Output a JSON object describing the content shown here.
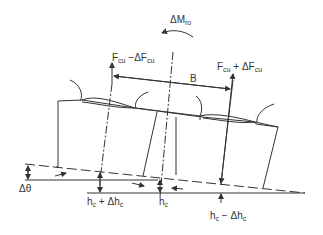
{
  "diagram": {
    "type": "tilted tyre pair / dual wheel contact mechanics",
    "stroke_color": "#333333",
    "labels": {
      "moment": {
        "prefix": "ΔM",
        "sub": "ro"
      },
      "force_left": {
        "a": "F",
        "a_sub": "cu",
        "op": " −ΔF",
        "b_sub": "cu"
      },
      "force_right": {
        "a": "F",
        "a_sub": "cu",
        "op": " + ΔF",
        "b_sub": "cu"
      },
      "span": "B",
      "angle": "Δθ",
      "height_left": {
        "a": "h",
        "a_sub": "c",
        "op": " + Δh",
        "b_sub": "c"
      },
      "height_center": {
        "a": "h",
        "a_sub": "c"
      },
      "height_right": {
        "a": "h",
        "a_sub": "c",
        "op": " − Δh",
        "b_sub": "c"
      }
    }
  }
}
